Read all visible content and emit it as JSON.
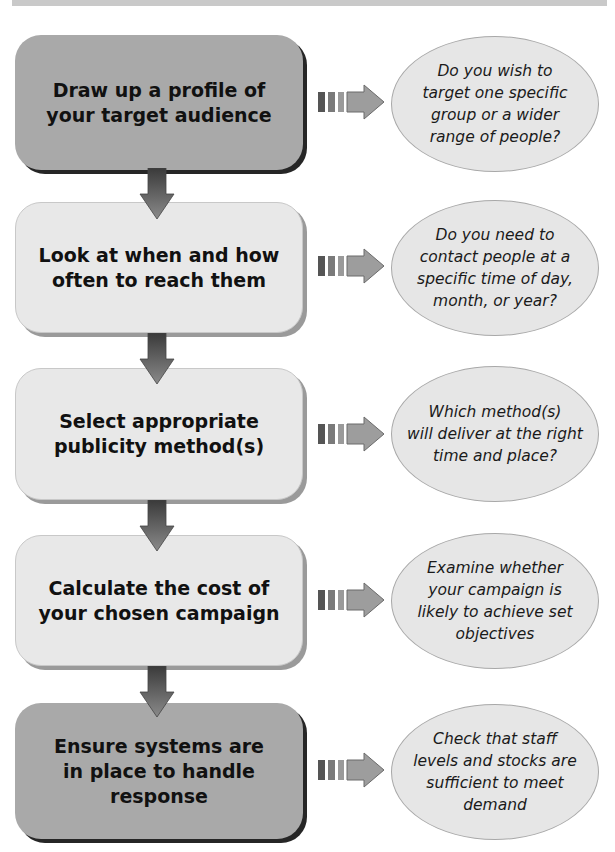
{
  "diagram": {
    "type": "flowchart",
    "direction": "top-to-bottom",
    "colors": {
      "dark_box": "#a9a9a9",
      "light_box": "#e8e8e8",
      "ellipse": "#e6e6e6",
      "arrow": "#6f6f6f",
      "text": "#111111"
    },
    "steps": [
      {
        "label": "Draw up a profile of\nyour target audience",
        "style": "dark",
        "note": "Do you wish to\ntarget one specific\ngroup or a wider\nrange of people?"
      },
      {
        "label": "Look at when and how\noften to reach them",
        "style": "light",
        "note": "Do you need to\ncontact people at a\nspecific time of day,\nmonth, or year?"
      },
      {
        "label": "Select appropriate\npublicity method(s)",
        "style": "light",
        "note": "Which method(s)\nwill deliver at the right\ntime and place?"
      },
      {
        "label": "Calculate the cost of\nyour chosen campaign",
        "style": "light",
        "note": "Examine whether\nyour campaign is\nlikely to achieve set\nobjectives"
      },
      {
        "label": "Ensure systems are\nin place to handle\nresponse",
        "style": "dark",
        "note": "Check that staff\nlevels and stocks are\nsufficient to meet\ndemand"
      }
    ],
    "icons": {
      "down_arrow": "down-arrow-icon",
      "connector": "striped-right-arrow-icon"
    }
  }
}
